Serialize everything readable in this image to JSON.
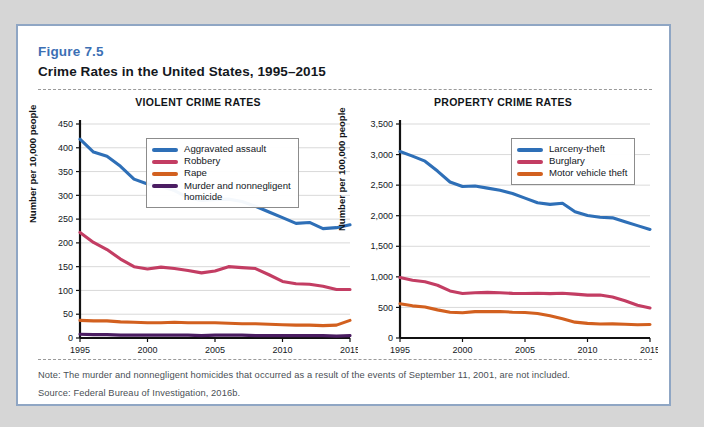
{
  "figure": {
    "number": "Figure 7.5",
    "title": "Crime Rates in the United States, 1995–2015",
    "note": "Note: The murder and nonnegligent homicides that occurred as a result of the events of September 11, 2001, are not included.",
    "source": "Source: Federal Bureau of Investigation, 2016b."
  },
  "colors": {
    "blue": "#2e6fb7",
    "rose": "#c33d63",
    "orange": "#d2601f",
    "purple": "#4b1d62",
    "frame": "#8fa6c4",
    "fig_number": "#3c6fb4",
    "gridline": "#c8c8c8",
    "axis": "#111111"
  },
  "chart_data": [
    {
      "type": "line",
      "title": "VIOLENT CRIME RATES",
      "xlabel": "",
      "ylabel": "Number per 10,000 people",
      "xlim": [
        1995,
        2015
      ],
      "ylim": [
        0,
        450
      ],
      "xticks": [
        1995,
        2000,
        2005,
        2010,
        2015
      ],
      "xticklabels": [
        "1995",
        "2000",
        "2005",
        "2010",
        "2015"
      ],
      "yticks": [
        0,
        50,
        100,
        150,
        200,
        250,
        300,
        350,
        400,
        450
      ],
      "yticklabels": [
        "0",
        "50",
        "100",
        "150",
        "200",
        "250",
        "300",
        "350",
        "400",
        "450"
      ],
      "grid": true,
      "legend_position": "top-right",
      "x": [
        1995,
        1996,
        1997,
        1998,
        1999,
        2000,
        2001,
        2002,
        2003,
        2004,
        2005,
        2006,
        2007,
        2008,
        2009,
        2010,
        2011,
        2012,
        2013,
        2014,
        2015
      ],
      "series": [
        {
          "name": "Aggravated assault",
          "color": "#2e6fb7",
          "values": [
            418,
            391,
            382,
            361,
            334,
            324,
            319,
            310,
            295,
            289,
            291,
            292,
            287,
            277,
            265,
            253,
            241,
            243,
            230,
            232,
            238
          ]
        },
        {
          "name": "Robbery",
          "color": "#c33d63",
          "values": [
            222,
            201,
            186,
            166,
            150,
            145,
            149,
            146,
            142,
            137,
            141,
            150,
            148,
            146,
            133,
            119,
            114,
            113,
            109,
            102,
            102
          ]
        },
        {
          "name": "Rape",
          "color": "#d2601f",
          "values": [
            37,
            36,
            36,
            34,
            33,
            32,
            32,
            33,
            32,
            32,
            32,
            31,
            30,
            30,
            29,
            28,
            27,
            27,
            26,
            27,
            37
          ]
        },
        {
          "name": "Murder and nonnegligent\nhomicide",
          "color": "#4b1d62",
          "values": [
            8,
            7,
            7,
            6,
            6,
            6,
            6,
            6,
            6,
            5,
            6,
            6,
            6,
            5,
            5,
            5,
            5,
            5,
            5,
            4,
            5
          ]
        }
      ]
    },
    {
      "type": "line",
      "title": "PROPERTY CRIME RATES",
      "xlabel": "",
      "ylabel": "Number per 100,000 people",
      "xlim": [
        1995,
        2015
      ],
      "ylim": [
        0,
        3500
      ],
      "xticks": [
        1995,
        2000,
        2005,
        2010,
        2015
      ],
      "xticklabels": [
        "1995",
        "2000",
        "2005",
        "2010",
        "2015"
      ],
      "yticks": [
        0,
        500,
        1000,
        1500,
        2000,
        2500,
        3000,
        3500
      ],
      "yticklabels": [
        "0",
        "500",
        "1,000",
        "1,500",
        "2,000",
        "2,500",
        "3,000",
        "3,500"
      ],
      "grid": true,
      "legend_position": "top-right",
      "x": [
        1995,
        1996,
        1997,
        1998,
        1999,
        2000,
        2001,
        2002,
        2003,
        2004,
        2005,
        2006,
        2007,
        2008,
        2009,
        2010,
        2011,
        2012,
        2013,
        2014,
        2015
      ],
      "series": [
        {
          "name": "Larceny-theft",
          "color": "#2e6fb7",
          "values": [
            3050,
            2975,
            2892,
            2730,
            2551,
            2477,
            2486,
            2451,
            2416,
            2362,
            2288,
            2213,
            2186,
            2203,
            2064,
            2005,
            1976,
            1965,
            1900,
            1838,
            1776
          ]
        },
        {
          "name": "Burglary",
          "color": "#c33d63",
          "values": [
            988,
            945,
            919,
            863,
            770,
            729,
            741,
            747,
            741,
            730,
            727,
            733,
            726,
            733,
            718,
            701,
            702,
            672,
            610,
            537,
            491
          ]
        },
        {
          "name": "Motor vehicle theft",
          "color": "#d2601f",
          "values": [
            561,
            526,
            506,
            460,
            422,
            412,
            431,
            432,
            433,
            422,
            417,
            400,
            364,
            315,
            259,
            239,
            230,
            231,
            224,
            216,
            221
          ]
        }
      ]
    }
  ]
}
